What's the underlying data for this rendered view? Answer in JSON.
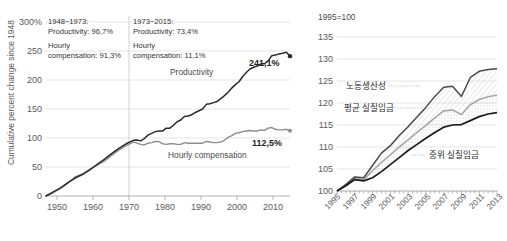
{
  "chart_data": [
    {
      "id": "left",
      "type": "line",
      "title": "",
      "ylabel": "Cumulative percent change since 1948",
      "xlabel": "",
      "ylim": [
        0,
        300
      ],
      "xlim": [
        1948,
        2015
      ],
      "ytick_labels": [
        "0",
        "50",
        "100",
        "150",
        "200",
        "250",
        "300%"
      ],
      "yticks": [
        0,
        50,
        100,
        150,
        200,
        250,
        300
      ],
      "xtick_labels": [
        "1950",
        "1960",
        "1970",
        "1980",
        "1990",
        "2000",
        "2010"
      ],
      "xticks": [
        1950,
        1960,
        1970,
        1980,
        1990,
        2000,
        2010
      ],
      "grid": true,
      "legend": "inline-labels",
      "divider_year": 1973,
      "annotations": [
        {
          "id": "period-1",
          "lines": [
            "1948~1973:",
            "Productivity: 96,7%",
            "Hourly",
            "compensation: 91,3%"
          ]
        },
        {
          "id": "period-2",
          "lines": [
            "1973~2015:",
            "Productivity: 73,4%",
            "Hourly",
            "compensation: 11,1%"
          ]
        }
      ],
      "series": [
        {
          "name": "Productivity",
          "label": "Productivity",
          "end_value_label": "241,1%",
          "color": "#2b2b2b",
          "x": [
            1948,
            1950,
            1952,
            1954,
            1956,
            1958,
            1960,
            1962,
            1964,
            1966,
            1968,
            1970,
            1972,
            1973,
            1974,
            1975,
            1976,
            1977,
            1978,
            1979,
            1980,
            1981,
            1982,
            1983,
            1984,
            1985,
            1986,
            1987,
            1988,
            1989,
            1990,
            1991,
            1992,
            1993,
            1994,
            1995,
            1996,
            1997,
            1998,
            1999,
            2000,
            2001,
            2002,
            2003,
            2004,
            2005,
            2006,
            2007,
            2008,
            2009,
            2010,
            2011,
            2012,
            2013,
            2014,
            2015
          ],
          "values": [
            0,
            7,
            14,
            23,
            31,
            37,
            45,
            54,
            63,
            73,
            82,
            90,
            96,
            96.7,
            95,
            99,
            105,
            108,
            111,
            112,
            112,
            117,
            117,
            122,
            128,
            131,
            137,
            138,
            140,
            144,
            147,
            150,
            158,
            159,
            161,
            163,
            168,
            173,
            179,
            186,
            192,
            197,
            206,
            213,
            219,
            222,
            224,
            228,
            228,
            233,
            242,
            243,
            245,
            246,
            248,
            241.1
          ]
        },
        {
          "name": "Hourly compensation",
          "label": "Hourly compensation",
          "end_value_label": "112,5%",
          "color": "#8e8e8e",
          "x": [
            1948,
            1950,
            1952,
            1954,
            1956,
            1958,
            1960,
            1962,
            1964,
            1966,
            1968,
            1970,
            1972,
            1973,
            1974,
            1975,
            1976,
            1977,
            1978,
            1979,
            1980,
            1981,
            1982,
            1983,
            1984,
            1985,
            1986,
            1987,
            1988,
            1989,
            1990,
            1991,
            1992,
            1993,
            1994,
            1995,
            1996,
            1997,
            1998,
            1999,
            2000,
            2001,
            2002,
            2003,
            2004,
            2005,
            2006,
            2007,
            2008,
            2009,
            2010,
            2011,
            2012,
            2013,
            2014,
            2015
          ],
          "values": [
            0,
            6,
            13,
            22,
            33,
            38,
            46,
            53,
            60,
            70,
            79,
            87,
            93,
            91.3,
            89,
            88,
            91,
            92,
            94,
            94,
            90,
            89,
            90,
            90,
            89,
            89,
            92,
            91,
            91,
            91,
            91,
            91,
            94,
            93,
            92,
            92,
            93,
            96,
            101,
            104,
            108,
            109,
            111,
            112,
            113,
            112,
            112,
            114,
            113,
            117,
            118,
            115,
            114,
            114,
            115,
            112.5
          ]
        }
      ]
    },
    {
      "id": "right",
      "type": "line",
      "title": "",
      "unit_note": "1995=100",
      "ylabel": "",
      "xlabel": "",
      "ylim": [
        100,
        135
      ],
      "xlim": [
        1995,
        2013
      ],
      "ytick_labels": [
        "100",
        "105",
        "110",
        "115",
        "120",
        "125",
        "130",
        "135"
      ],
      "yticks": [
        100,
        105,
        110,
        115,
        120,
        125,
        130,
        135
      ],
      "xtick_labels": [
        "1995",
        "1997",
        "1999",
        "2001",
        "2003",
        "2005",
        "2007",
        "2009",
        "2011",
        "2013"
      ],
      "xticks": [
        1995,
        1997,
        1999,
        2001,
        2003,
        2005,
        2007,
        2009,
        2011,
        2013
      ],
      "grid": true,
      "legend": "inline-labels",
      "series": [
        {
          "name": "labor-productivity",
          "label": "노동생산성",
          "color": "#4a4a4a",
          "x": [
            1995,
            1996,
            1997,
            1998,
            1999,
            2000,
            2001,
            2002,
            2003,
            2004,
            2005,
            2006,
            2007,
            2008,
            2009,
            2010,
            2011,
            2012,
            2013
          ],
          "values": [
            100,
            101.5,
            103.2,
            103.0,
            105.8,
            108.6,
            110.3,
            112.6,
            114.6,
            116.8,
            119.0,
            121.5,
            123.6,
            123.8,
            121.5,
            125.8,
            127.2,
            127.6,
            127.8
          ]
        },
        {
          "name": "average-real-wage",
          "label": "평균 실질임금",
          "color": "#a8a8a8",
          "x": [
            1995,
            1996,
            1997,
            1998,
            1999,
            2000,
            2001,
            2002,
            2003,
            2004,
            2005,
            2006,
            2007,
            2008,
            2009,
            2010,
            2011,
            2012,
            2013
          ],
          "values": [
            100,
            101.3,
            102.8,
            102.6,
            104.6,
            106.5,
            108.2,
            110.0,
            111.6,
            113.3,
            114.9,
            116.6,
            118.2,
            118.4,
            117.4,
            119.6,
            120.8,
            121.4,
            121.8
          ]
        },
        {
          "name": "median-real-wage",
          "label": "중위 실질임금",
          "color": "#1c1c1c",
          "x": [
            1995,
            1996,
            1997,
            1998,
            1999,
            2000,
            2001,
            2002,
            2003,
            2004,
            2005,
            2006,
            2007,
            2008,
            2009,
            2010,
            2011,
            2012,
            2013
          ],
          "values": [
            100,
            101.2,
            102.6,
            102.3,
            103.0,
            104.4,
            106.0,
            107.6,
            109.2,
            110.6,
            112.0,
            113.3,
            114.5,
            115.0,
            115.1,
            116.0,
            116.9,
            117.5,
            117.8
          ]
        }
      ]
    }
  ]
}
